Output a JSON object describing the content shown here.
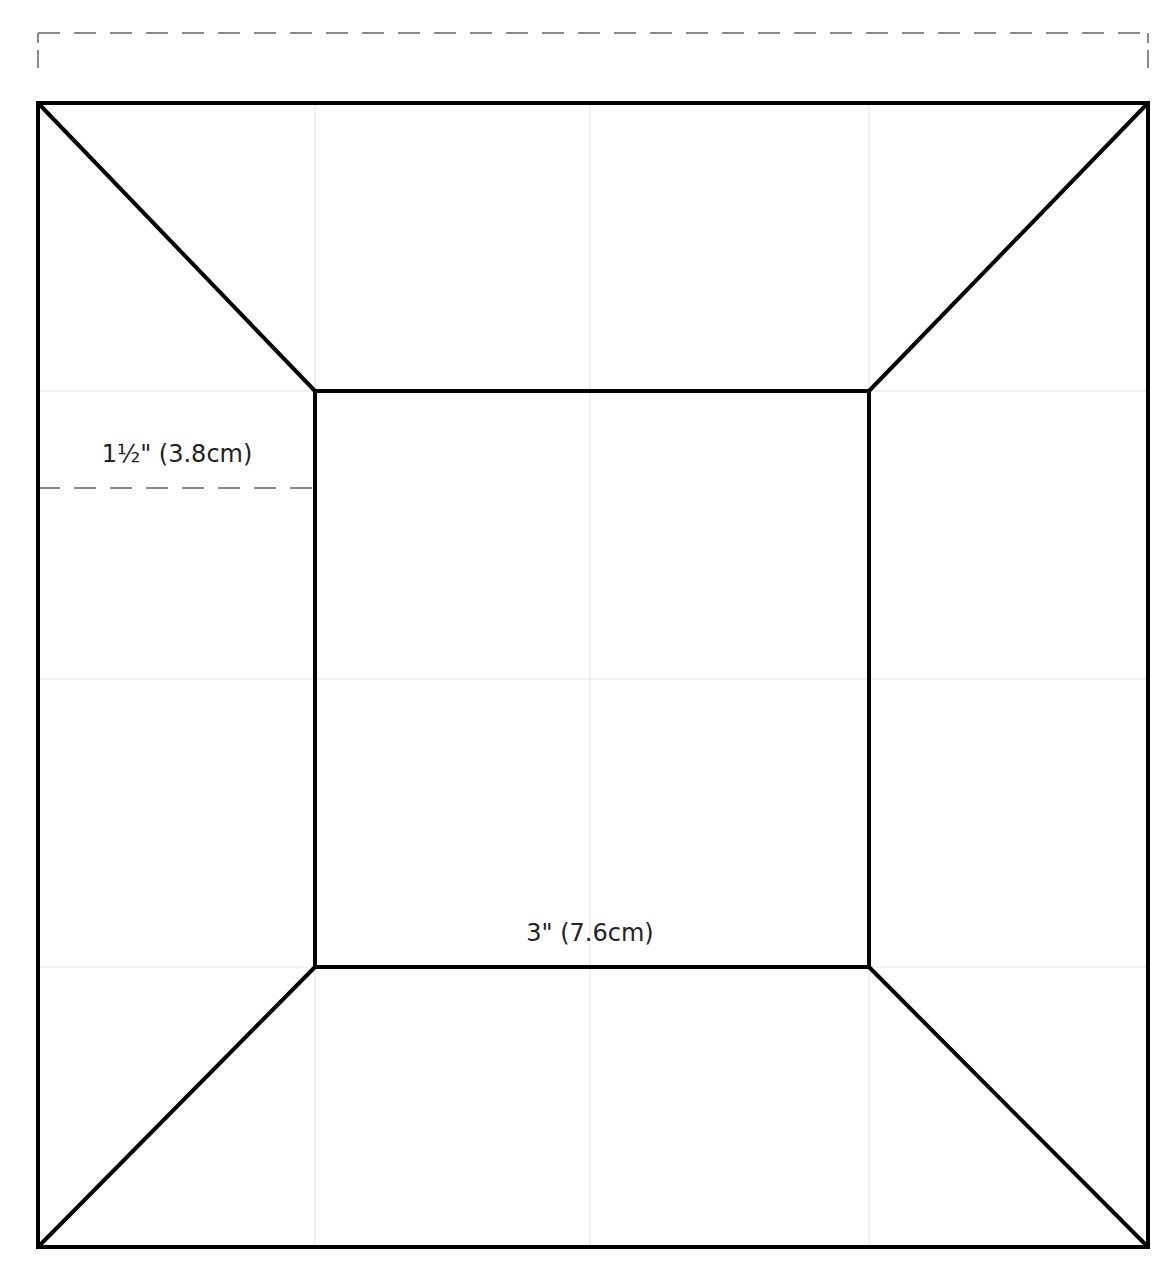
{
  "diagram": {
    "type": "quilt-block-template",
    "colors": {
      "outline": "#000000",
      "grid": "#e2e2e2",
      "dashed_guide": "#8a8a8a",
      "text": "#222222",
      "background": "#ffffff"
    },
    "grid": {
      "columns": 4,
      "rows": 4
    },
    "labels": {
      "border_width": "1½\" (3.8cm)",
      "center_square_width": "3\" (7.6cm)",
      "top_dimension": ""
    },
    "pieces": [
      {
        "name": "center-square",
        "shape": "square"
      },
      {
        "name": "top-border",
        "shape": "trapezoid"
      },
      {
        "name": "right-border",
        "shape": "trapezoid"
      },
      {
        "name": "bottom-border",
        "shape": "trapezoid"
      },
      {
        "name": "left-border",
        "shape": "trapezoid"
      }
    ]
  }
}
